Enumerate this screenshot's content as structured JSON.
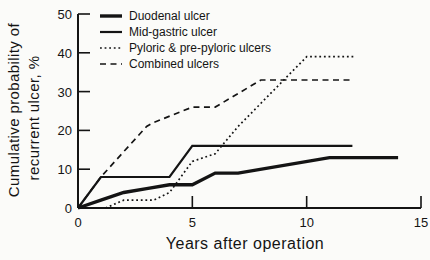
{
  "figure": {
    "background": "#fbfbf9",
    "ink": "#141414"
  },
  "chart_data": {
    "type": "line",
    "title": "",
    "xlabel": "Years after operation",
    "ylabel_line1": "Cumulative probability of",
    "ylabel_line2": "recurrent ulcer, %",
    "xlim": [
      0,
      15
    ],
    "ylim": [
      0,
      50
    ],
    "xticks": [
      0,
      5,
      10,
      15
    ],
    "yticks": [
      0,
      10,
      20,
      30,
      40,
      50
    ],
    "grid": false,
    "legend_position": "top-left-inside",
    "series": [
      {
        "name": "Duodenal ulcer",
        "style": "solid-thick",
        "points": [
          [
            0,
            0
          ],
          [
            1,
            2
          ],
          [
            2,
            4
          ],
          [
            3,
            5
          ],
          [
            4,
            6
          ],
          [
            5,
            6
          ],
          [
            6,
            9
          ],
          [
            7,
            9
          ],
          [
            11,
            13
          ],
          [
            14,
            13
          ]
        ]
      },
      {
        "name": "Mid-gastric ulcer",
        "style": "solid",
        "points": [
          [
            0,
            0
          ],
          [
            1,
            8
          ],
          [
            4,
            8
          ],
          [
            5,
            16
          ],
          [
            12,
            16
          ]
        ]
      },
      {
        "name": "Pyloric & pre-pyloric ulcers",
        "style": "dotted",
        "points": [
          [
            0,
            0
          ],
          [
            1.2,
            0
          ],
          [
            2,
            2
          ],
          [
            3.3,
            2
          ],
          [
            4,
            4
          ],
          [
            5,
            12
          ],
          [
            6,
            14
          ],
          [
            7,
            21
          ],
          [
            10,
            39
          ],
          [
            12.1,
            39
          ]
        ]
      },
      {
        "name": "Combined ulcers",
        "style": "dashed",
        "points": [
          [
            0,
            0
          ],
          [
            1,
            8
          ],
          [
            2,
            14.5
          ],
          [
            3,
            21
          ],
          [
            3.3,
            22
          ],
          [
            5,
            26
          ],
          [
            6,
            26
          ],
          [
            8,
            33
          ],
          [
            12,
            33
          ]
        ]
      }
    ]
  }
}
